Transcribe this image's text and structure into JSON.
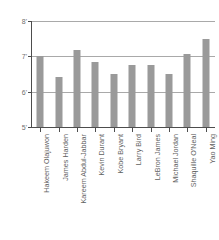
{
  "chart_data": {
    "type": "bar",
    "title": "",
    "subtitle": "",
    "xlabel": "",
    "ylabel": "",
    "grid": true,
    "legend": false,
    "legend_position": "none",
    "ylim": [
      5,
      8
    ],
    "y_unit": "feet",
    "y_ticks": [
      5,
      6,
      7,
      8
    ],
    "y_tick_labels": [
      "5'",
      "6'",
      "7'",
      "8'"
    ],
    "categories": [
      "Hakeem Olajuwon",
      "James Harden",
      "Kareem Abdul-Jabbar",
      "Kevin Durant",
      "Kobe Bryant",
      "Larry Bird",
      "LeBron James",
      "Michael Jordan",
      "Shaquille O'Neal",
      "Yao Ming"
    ],
    "values": [
      7.0,
      6.42,
      7.17,
      6.83,
      6.5,
      6.75,
      6.75,
      6.5,
      7.08,
      7.5
    ],
    "value_labels": [
      "7'0\"",
      "6'5\"",
      "7'2\"",
      "6'10\"",
      "6'6\"",
      "6'9\"",
      "6'9\"",
      "6'6\"",
      "7'1\"",
      "7'6\""
    ],
    "bar_color": "#9a9a9a",
    "gridline_color": "#a9a9a9",
    "axis_color": "#4d4d4d",
    "background_color": "#ffffff"
  }
}
